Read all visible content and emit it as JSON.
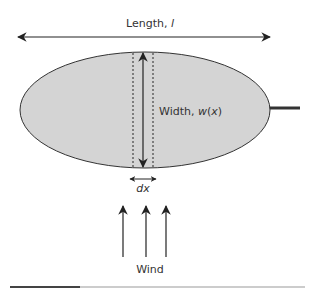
{
  "diagram": {
    "labels": {
      "length": "Length, ",
      "length_var": "l",
      "width": "Width, ",
      "width_var_w": "w",
      "width_var_open": "(",
      "width_var_x": "x",
      "width_var_close": ")",
      "dx": "dx",
      "wind": "Wind"
    },
    "colors": {
      "fill": "#d4d4d4",
      "stroke": "#333333",
      "line": "#222222",
      "bottom_rule": "#cccccc",
      "bottom_rule_dark": "#444444"
    },
    "elements": [
      "length-arrow",
      "elliptical-body",
      "width-arrow",
      "strip-boundaries-dashed",
      "dx-arrow",
      "wind-arrows-3",
      "stem"
    ]
  }
}
